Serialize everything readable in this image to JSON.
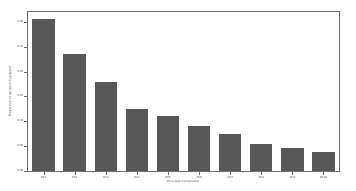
{
  "chart_data": {
    "type": "bar",
    "title": "",
    "xlabel": "Principal Component",
    "ylabel": "Proportion of Variance Explained",
    "categories": [
      "PC1",
      "PC2",
      "PC3",
      "PC4",
      "PC5",
      "PC6",
      "PC7",
      "PC8",
      "PC9",
      "PC10"
    ],
    "values": [
      0.305,
      0.235,
      0.18,
      0.125,
      0.11,
      0.09,
      0.075,
      0.055,
      0.046,
      0.039
    ],
    "ylim": [
      0.0,
      0.32
    ],
    "xlim": [
      0,
      10
    ],
    "ytick_labels": [
      "0.00",
      "0.05",
      "0.10",
      "0.15",
      "0.20",
      "0.25",
      "0.30"
    ],
    "ytick_values": [
      0.0,
      0.05,
      0.1,
      0.15,
      0.2,
      0.25,
      0.3
    ],
    "grid": false,
    "legend": false,
    "legend_position": "none",
    "bar_color": "#575757",
    "axis_color": "#6e6e6e",
    "background_color": "#ffffff",
    "series": [
      {
        "name": "Proportion of Variance Explained",
        "values": [
          0.305,
          0.235,
          0.18,
          0.125,
          0.11,
          0.09,
          0.075,
          0.055,
          0.046,
          0.039
        ]
      }
    ]
  }
}
